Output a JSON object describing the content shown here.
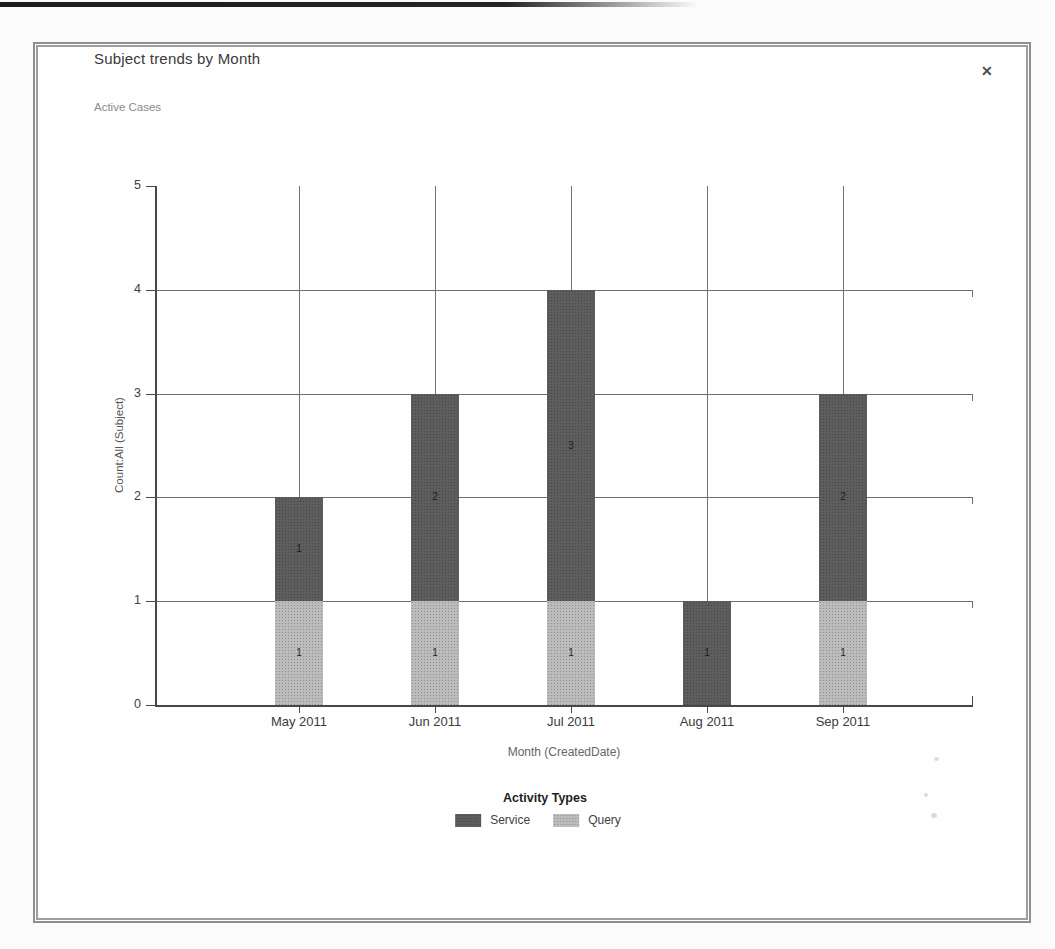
{
  "dialog": {
    "title": "Subject trends by Month",
    "subtitle": "Active Cases",
    "close_glyph": "✕"
  },
  "chart_data": {
    "type": "bar",
    "stacked": true,
    "categories": [
      "May 2011",
      "Jun 2011",
      "Jul 2011",
      "Aug 2011",
      "Sep 2011"
    ],
    "series": [
      {
        "name": "Service",
        "color": "#5d5d5d",
        "values": [
          1,
          2,
          3,
          1,
          2
        ]
      },
      {
        "name": "Query",
        "color": "#bcbcbc",
        "values": [
          1,
          1,
          1,
          0,
          1
        ]
      }
    ],
    "stack_order_bottom_up": [
      "Query",
      "Service"
    ],
    "totals": [
      2,
      3,
      4,
      1,
      3
    ],
    "bar_value_labels": true,
    "xlabel": "Month (CreatedDate)",
    "ylabel": "Count:All (Subject)",
    "ylim": [
      0,
      5
    ],
    "yticks": [
      0,
      1,
      2,
      3,
      4,
      5
    ],
    "grid": true,
    "legend": {
      "title": "Activity Types",
      "position": "bottom"
    }
  }
}
